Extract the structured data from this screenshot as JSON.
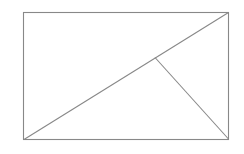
{
  "diagram": {
    "type": "geometry",
    "stroke_color": "#888888",
    "background": "#ffffff",
    "rectangle": {
      "x": 23.5,
      "y": 12.5,
      "width": 205,
      "height": 127
    },
    "diagonal": {
      "x1": 24,
      "y1": 139.5,
      "x2": 228.5,
      "y2": 12.5
    },
    "perpendicular": {
      "x1": 155,
      "y1": 57.5,
      "x2": 228.5,
      "y2": 139
    },
    "labels": []
  }
}
